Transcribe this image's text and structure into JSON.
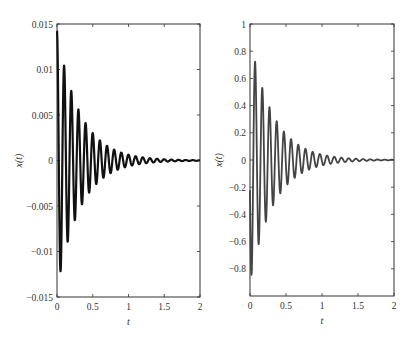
{
  "chart_data": [
    {
      "type": "line",
      "title": "",
      "xlabel": "t",
      "ylabel": "x(t)",
      "xlim": [
        0,
        2
      ],
      "ylim": [
        -0.015,
        0.015
      ],
      "xticks": [
        "0",
        "0.5",
        "1",
        "1.5",
        "2"
      ],
      "yticks": [
        "0.015",
        "0.01",
        "0.005",
        "0",
        "-0.005",
        "-0.01",
        "-0.015"
      ],
      "grid": false,
      "line_color": "#111111",
      "description": "Damped oscillation (displacement), frequency ~10 Hz, decaying to ~0 by t=2",
      "model": {
        "amplitude": 0.0142,
        "decay": 3.1,
        "frequency_hz": 10,
        "form": "cos"
      },
      "peaks": [
        {
          "t": 0.0,
          "x": 0.0142
        },
        {
          "t": 0.1,
          "x": 0.0103
        },
        {
          "t": 0.2,
          "x": 0.0075
        },
        {
          "t": 0.3,
          "x": 0.0055
        },
        {
          "t": 0.4,
          "x": 0.004
        },
        {
          "t": 0.5,
          "x": 0.003
        },
        {
          "t": 0.6,
          "x": 0.002
        },
        {
          "t": 0.7,
          "x": 0.0015
        },
        {
          "t": 0.8,
          "x": 0.001
        }
      ],
      "troughs": [
        {
          "t": 0.05,
          "x": -0.0122
        },
        {
          "t": 0.15,
          "x": -0.0088
        },
        {
          "t": 0.25,
          "x": -0.0064
        },
        {
          "t": 0.35,
          "x": -0.0047
        },
        {
          "t": 0.45,
          "x": -0.0034
        }
      ]
    },
    {
      "type": "line",
      "title": "",
      "xlabel": "t",
      "ylabel": "x(t)",
      "xlim": [
        0,
        2
      ],
      "ylim": [
        -1,
        1
      ],
      "xticks": [
        "0",
        "0.5",
        "1",
        "1.5",
        "2"
      ],
      "yticks": [
        "1",
        "0.8",
        "0.6",
        "0.4",
        "0.2",
        "0",
        "-0.2",
        "-0.4",
        "-0.6",
        "-0.8"
      ],
      "grid": false,
      "line_color": "#444444",
      "description": "Damped oscillation (velocity-like), frequency ~10 Hz, starts near 0 with first deep trough",
      "model": {
        "amplitude": 0.9,
        "decay": 3.1,
        "frequency_hz": 10,
        "form": "-sin"
      },
      "peaks": [
        {
          "t": 0.07,
          "x": 0.73
        },
        {
          "t": 0.17,
          "x": 0.53
        },
        {
          "t": 0.27,
          "x": 0.38
        },
        {
          "t": 0.37,
          "x": 0.28
        },
        {
          "t": 0.47,
          "x": 0.2
        },
        {
          "t": 0.57,
          "x": 0.15
        },
        {
          "t": 0.67,
          "x": 0.11
        }
      ],
      "troughs": [
        {
          "t": 0.02,
          "x": -0.85
        },
        {
          "t": 0.12,
          "x": -0.62
        },
        {
          "t": 0.22,
          "x": -0.45
        },
        {
          "t": 0.32,
          "x": -0.33
        },
        {
          "t": 0.42,
          "x": -0.24
        }
      ]
    }
  ],
  "plots": [
    {
      "ylabel": "x(t)",
      "xlabel": "t"
    },
    {
      "ylabel": "x(t)",
      "xlabel": "t"
    }
  ]
}
